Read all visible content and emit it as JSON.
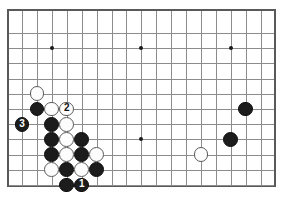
{
  "figure": {
    "name": "go-board-diagram",
    "kind": "go-game-diagram",
    "board": {
      "columns": 17,
      "rows": 12,
      "origin_x": 22,
      "origin_y": 33,
      "spacing_x": 14.92,
      "spacing_y": 15.2,
      "border_color": "#595959",
      "grid_color": "#8c8c8c",
      "background_color": "#ffffff"
    },
    "star_points": [
      {
        "name": "star-point-left-top",
        "col": 2,
        "row": 1
      },
      {
        "name": "star-point-center-top",
        "col": 8,
        "row": 1
      },
      {
        "name": "star-point-right-top",
        "col": 14,
        "row": 1
      },
      {
        "name": "star-point-center",
        "col": 8,
        "row": 7
      }
    ],
    "stones": [
      {
        "name": "white-stone-a",
        "color": "white",
        "col": 1,
        "row": 4,
        "label": ""
      },
      {
        "name": "black-stone-a",
        "color": "black",
        "col": 1,
        "row": 5,
        "label": ""
      },
      {
        "name": "white-stone-b",
        "color": "white",
        "col": 2,
        "row": 5,
        "label": ""
      },
      {
        "name": "white-stone-move-2",
        "color": "white",
        "col": 3,
        "row": 5,
        "label": "2"
      },
      {
        "name": "black-stone-move-3",
        "color": "black",
        "col": 0,
        "row": 6,
        "label": "3"
      },
      {
        "name": "black-stone-b",
        "color": "black",
        "col": 2,
        "row": 6,
        "label": ""
      },
      {
        "name": "white-stone-c",
        "color": "white",
        "col": 3,
        "row": 6,
        "label": ""
      },
      {
        "name": "black-stone-c",
        "color": "black",
        "col": 2,
        "row": 7,
        "label": ""
      },
      {
        "name": "white-stone-d",
        "color": "white",
        "col": 3,
        "row": 7,
        "label": ""
      },
      {
        "name": "black-stone-d",
        "color": "black",
        "col": 4,
        "row": 7,
        "label": ""
      },
      {
        "name": "black-stone-e",
        "color": "black",
        "col": 2,
        "row": 8,
        "label": ""
      },
      {
        "name": "white-stone-e",
        "color": "white",
        "col": 3,
        "row": 8,
        "label": ""
      },
      {
        "name": "black-stone-f",
        "color": "black",
        "col": 4,
        "row": 8,
        "label": ""
      },
      {
        "name": "white-stone-f",
        "color": "white",
        "col": 5,
        "row": 8,
        "label": ""
      },
      {
        "name": "white-stone-g",
        "color": "white",
        "col": 2,
        "row": 9,
        "label": ""
      },
      {
        "name": "black-stone-g",
        "color": "black",
        "col": 3,
        "row": 9,
        "label": ""
      },
      {
        "name": "white-stone-h",
        "color": "white",
        "col": 4,
        "row": 9,
        "label": ""
      },
      {
        "name": "black-stone-h",
        "color": "black",
        "col": 5,
        "row": 9,
        "label": ""
      },
      {
        "name": "black-stone-i",
        "color": "black",
        "col": 3,
        "row": 10,
        "label": ""
      },
      {
        "name": "black-stone-move-1",
        "color": "black",
        "col": 4,
        "row": 10,
        "label": "1"
      },
      {
        "name": "black-stone-right-upper",
        "color": "black",
        "col": 15,
        "row": 5,
        "label": ""
      },
      {
        "name": "black-stone-right-lower",
        "color": "black",
        "col": 14,
        "row": 7,
        "label": ""
      },
      {
        "name": "white-stone-right-lower",
        "color": "white",
        "col": 12,
        "row": 8,
        "label": ""
      }
    ],
    "stone_radius": 7.4,
    "colors": {
      "black_fill": "#1c1c1c",
      "black_label": "#ffffff",
      "white_fill": "#fdfdfd",
      "white_outline": "#5a5a5a",
      "white_label": "#111111"
    }
  }
}
